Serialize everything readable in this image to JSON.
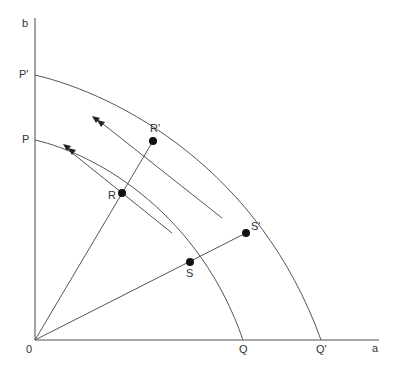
{
  "diagram": {
    "type": "production-possibility-frontiers",
    "axes": {
      "y_label": "b",
      "x_label": "a",
      "origin_label": "0"
    },
    "curves": [
      {
        "name": "inner-frontier",
        "start_label": "P",
        "end_label": "Q"
      },
      {
        "name": "outer-frontier",
        "start_label": "P'",
        "end_label": "Q'"
      }
    ],
    "points": [
      {
        "label": "R",
        "on": "inner-frontier"
      },
      {
        "label": "R'",
        "on": "outer-frontier"
      },
      {
        "label": "S",
        "on": "inner-frontier"
      },
      {
        "label": "S'",
        "on": "outer-frontier"
      }
    ],
    "rays": [
      {
        "from": "0",
        "through": "R",
        "to": "R'"
      },
      {
        "from": "0",
        "through": "S",
        "to": "S'"
      }
    ],
    "tangents": [
      {
        "at": "R",
        "arrow": "double-arrowhead-up-left"
      },
      {
        "at": "R'",
        "arrow": "double-arrowhead-up-left"
      }
    ],
    "colors": {
      "line": "#555555",
      "dot": "#111111",
      "text": "#333333",
      "background": "#ffffff"
    }
  }
}
